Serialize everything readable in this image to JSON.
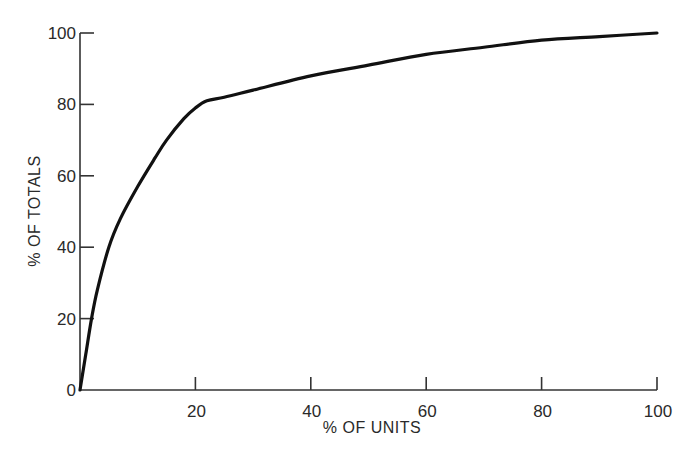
{
  "chart_data": {
    "type": "line",
    "title": "",
    "xlabel": "% OF UNITS",
    "ylabel": "% OF TOTALS",
    "xlim": [
      0,
      100
    ],
    "ylim": [
      0,
      100
    ],
    "grid": false,
    "legend": null,
    "x_ticks": [
      20,
      40,
      60,
      80,
      100
    ],
    "y_ticks": [
      0,
      20,
      40,
      60,
      80,
      100
    ],
    "series": [
      {
        "name": "cumulative curve",
        "x": [
          0,
          1,
          2,
          3,
          5,
          7,
          10,
          13,
          15,
          18,
          20,
          22,
          25,
          30,
          40,
          50,
          60,
          70,
          80,
          90,
          100
        ],
        "y": [
          0,
          10,
          20,
          28,
          40,
          48,
          57,
          65,
          70,
          76,
          79,
          81,
          82,
          84,
          88,
          91,
          94,
          96,
          98,
          99,
          100
        ]
      }
    ]
  },
  "plot": {
    "origin_px": [
      80,
      390
    ],
    "x_max_px": 657,
    "y_max_px": 33,
    "line_color": "#111111",
    "axis_color": "#333333"
  }
}
